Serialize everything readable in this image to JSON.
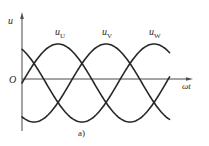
{
  "figure": {
    "caption": "a)",
    "y_axis_label": "u",
    "x_axis_label": "ωt",
    "origin_label": "O"
  },
  "series_labels": [
    {
      "main": "u",
      "sub": "U"
    },
    {
      "main": "u",
      "sub": "V"
    },
    {
      "main": "u",
      "sub": "W"
    }
  ],
  "chart_data": {
    "type": "line",
    "title": "",
    "caption": "a)",
    "xlabel": "ωt",
    "ylabel": "u",
    "grid": false,
    "legend": "inline labels above each peak",
    "x_range_deg": [
      0,
      370
    ],
    "amplitude": 1,
    "series": [
      {
        "name": "u_U",
        "phase_deg": 0,
        "formula": "sin(ωt)"
      },
      {
        "name": "u_V",
        "phase_deg": -120,
        "formula": "sin(ωt - 120°)"
      },
      {
        "name": "u_W",
        "phase_deg": 120,
        "formula": "sin(ωt + 120°)"
      }
    ],
    "colors": {
      "curves": "#262626",
      "axes": "#4a4a4a"
    }
  }
}
